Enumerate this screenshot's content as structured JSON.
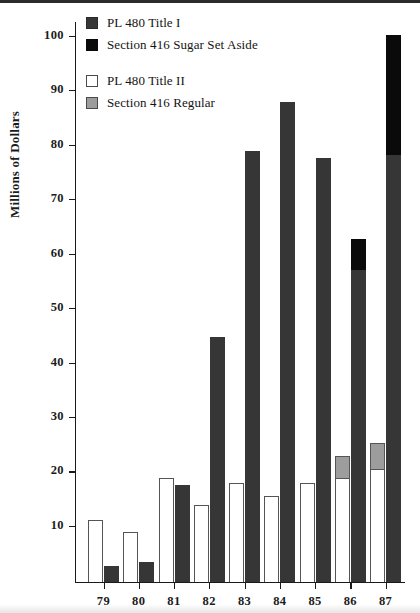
{
  "chart_data": {
    "type": "bar",
    "title": "",
    "subtitle": "",
    "xlabel": "",
    "ylabel": "Millions of Dollars",
    "categories": [
      "79",
      "80",
      "81",
      "82",
      "83",
      "84",
      "85",
      "86",
      "87"
    ],
    "ylim": [
      0,
      103
    ],
    "yticks": [
      10,
      20,
      30,
      40,
      50,
      60,
      70,
      80,
      90,
      100
    ],
    "ytick_labels": [
      "10",
      "20",
      "30",
      "40",
      "50",
      "60",
      "70",
      "80",
      "90",
      "100"
    ],
    "grid": false,
    "legend_position": "top-left",
    "bar_layout": "grouped-pairs-stacked",
    "series": [
      {
        "name": "PL 480 Title II",
        "color": "#ffffff",
        "stack": "left",
        "values": [
          11.4,
          9.2,
          19.1,
          14.0,
          18.1,
          15.7,
          18.1,
          19.0,
          20.7
        ]
      },
      {
        "name": "Section 416 Regular",
        "color": "#9d9d9d",
        "stack": "left",
        "values": [
          0,
          0,
          0,
          0,
          0,
          0,
          0,
          4.0,
          4.7
        ]
      },
      {
        "name": "PL 480 Title I",
        "color": "#363636",
        "stack": "right",
        "values": [
          2.9,
          3.6,
          17.7,
          45.0,
          79.0,
          88.0,
          77.8,
          57.3,
          78.3
        ]
      },
      {
        "name": "Section 416 Sugar Set Aside",
        "color": "#0a0a0a",
        "stack": "right",
        "values": [
          0,
          0,
          0,
          0,
          0,
          0,
          0,
          5.6,
          22.0
        ]
      }
    ],
    "left_totals": [
      11.4,
      9.2,
      19.1,
      14.0,
      18.1,
      15.7,
      18.1,
      23.0,
      25.4
    ],
    "right_totals": [
      2.9,
      3.6,
      17.7,
      45.0,
      79.0,
      88.0,
      77.8,
      62.9,
      100.3
    ]
  },
  "legend": {
    "entries": [
      {
        "label": "PL 480 Title I",
        "swatch": "darkgray-swatch-icon"
      },
      {
        "label": "Section 416 Sugar Set Aside",
        "swatch": "black-swatch-icon"
      },
      {
        "label": "PL 480 Title II",
        "swatch": "white-swatch-icon"
      },
      {
        "label": "Section 416 Regular",
        "swatch": "gray-swatch-icon"
      }
    ]
  },
  "axis": {
    "y_title": "Millions of Dollars"
  }
}
